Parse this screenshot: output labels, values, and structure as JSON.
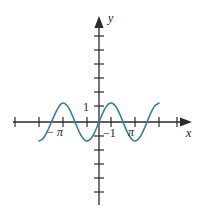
{
  "figure": {
    "background_color": "#ffffff",
    "width": 206,
    "height": 216
  },
  "axes": {
    "x_axis_label": "x",
    "y_axis_label": "y",
    "axis_color": "#2b2b2b",
    "origin_px": {
      "x": 99,
      "y": 122
    },
    "px_per_unit_x": 7.64,
    "px_per_unit_y": 19.0,
    "x_tick_labels": [
      {
        "text": "− π",
        "value": -3.14159
      },
      {
        "text": "π",
        "value": 3.14159
      }
    ],
    "y_tick_labels": [
      {
        "text": "1",
        "value": 1
      },
      {
        "text": "−1",
        "value": -1
      }
    ]
  },
  "chart_data": {
    "type": "line",
    "title": "",
    "subtitle": "",
    "xlabel": "x",
    "ylabel": "y",
    "function": "y = sin(x)",
    "line_color": "#3a7ca5",
    "line_width": 1.6,
    "grid": false,
    "legend": null,
    "xlim": [
      -11.2,
      12.4
    ],
    "ylim": [
      -5.6,
      5.0
    ],
    "x_tick_step": 1.5708,
    "y_tick_step": 1.0,
    "x_ticks": [
      -10.9956,
      -9.4248,
      -7.854,
      -6.2832,
      -4.7124,
      -3.14159,
      -1.5708,
      0,
      1.5708,
      3.14159,
      4.7124,
      6.2832,
      7.854,
      9.4248,
      10.9956
    ],
    "y_ticks": [
      -5,
      -4,
      -3,
      -2,
      -1,
      0,
      1,
      2,
      3,
      4,
      5
    ],
    "x": [
      -7.854,
      -7.454,
      -7.054,
      -6.654,
      -6.254,
      -5.854,
      -5.454,
      -5.054,
      -4.654,
      -4.254,
      -3.854,
      -3.454,
      -3.054,
      -2.654,
      -2.254,
      -1.854,
      -1.454,
      -1.054,
      -0.654,
      -0.254,
      0.146,
      0.546,
      0.946,
      1.346,
      1.746,
      2.146,
      2.546,
      2.946,
      3.346,
      3.746,
      4.146,
      4.546,
      4.946,
      5.346,
      5.746,
      6.146,
      6.546,
      6.946,
      7.346,
      7.854
    ],
    "y": [
      -1.0,
      -0.9211,
      -0.7086,
      -0.3936,
      -0.029,
      0.3402,
      0.6675,
      0.9121,
      0.9994,
      0.8947,
      0.6637,
      0.3097,
      -0.0876,
      -0.4671,
      -0.7727,
      -0.9608,
      -0.9928,
      -0.8701,
      -0.6083,
      -0.2513,
      0.1455,
      0.5193,
      0.8106,
      0.9753,
      0.9849,
      0.8393,
      0.5606,
      0.1991,
      -0.2043,
      -0.5647,
      -0.8416,
      -0.9871,
      -0.9692,
      -0.8003,
      -0.5085,
      -0.1406,
      0.2541,
      0.6105,
      0.8716,
      1.0
    ],
    "curve_x_domain": [
      -7.854,
      7.854
    ],
    "annotations": []
  }
}
